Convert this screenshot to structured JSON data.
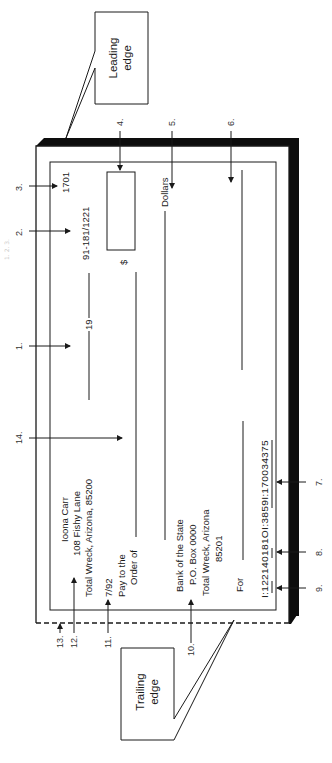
{
  "figure": {
    "orientation": "rotated 90 degrees counter-clockwise",
    "margin_caption_faint": "1. 2. 3."
  },
  "callouts": {
    "leading_edge": {
      "line1": "Leading",
      "line2": "edge"
    },
    "trailing_edge": {
      "line1": "Trailing",
      "line2": "edge"
    }
  },
  "check": {
    "check_number": "1701",
    "routing_fraction": "91-181/1221",
    "date_prefix": "19",
    "dollar_sign": "$",
    "dollars_label": "Dollars",
    "drawer": {
      "name": "Ioona Carr",
      "street": "108 Fishy Lane",
      "city": "Total Wreck, Arizona, 85200"
    },
    "account_opened": "7/92",
    "payee_label_1": "Pay to the",
    "payee_label_2": "Order of",
    "bank": {
      "name": "Bank of the State",
      "po_box": "P.O. Box 0000",
      "city": "Total Wreck, Arizona",
      "zip": "85201"
    },
    "memo_label": "For",
    "micr_line": "I:122140181OI:3859I:170034375"
  },
  "markers": [
    {
      "id": "1",
      "label": "1."
    },
    {
      "id": "2",
      "label": "2."
    },
    {
      "id": "3",
      "label": "3."
    },
    {
      "id": "4",
      "label": "4."
    },
    {
      "id": "5",
      "label": "5."
    },
    {
      "id": "6",
      "label": "6."
    },
    {
      "id": "7",
      "label": "7."
    },
    {
      "id": "8",
      "label": "8."
    },
    {
      "id": "9",
      "label": "9."
    },
    {
      "id": "10",
      "label": "10."
    },
    {
      "id": "11",
      "label": "11."
    },
    {
      "id": "12",
      "label": "12."
    },
    {
      "id": "13",
      "label": "13."
    },
    {
      "id": "14",
      "label": "14."
    }
  ],
  "colors": {
    "ink": "#1a1a1a",
    "shadow": "#0d0d0d",
    "background": "#ffffff"
  }
}
